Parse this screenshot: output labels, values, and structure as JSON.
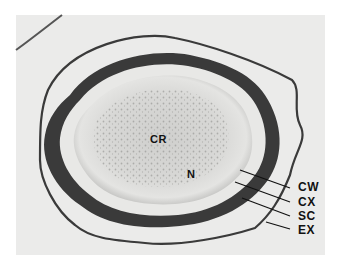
{
  "figure": {
    "type": "micrograph",
    "labels": {
      "cr": "CR",
      "n": "N",
      "cw": "CW",
      "cx": "CX",
      "sc": "SC",
      "ex": "EX"
    },
    "colors": {
      "background": "#ffffff",
      "photo_bg": "#ebebea",
      "dark_wall": "#2a2a2a",
      "label": "#111111"
    }
  }
}
